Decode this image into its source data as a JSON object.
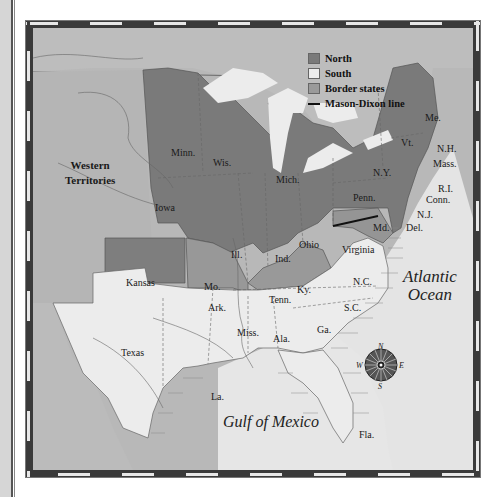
{
  "legend": {
    "items": [
      {
        "label": "North",
        "color": "#7a7a7a"
      },
      {
        "label": "South",
        "color": "#ececec"
      },
      {
        "label": "Border states",
        "color": "#9a9a9a"
      },
      {
        "label": "Mason-Dixon line",
        "color": "#111111"
      }
    ]
  },
  "regions": {
    "western_territories": [
      "Western",
      "Territories"
    ],
    "north": [
      "Minn.",
      "Wis.",
      "Mich.",
      "Iowa",
      "Ill.",
      "Ind.",
      "Ohio",
      "Kansas",
      "Penn.",
      "N.Y.",
      "Vt.",
      "Me.",
      "N.H.",
      "Mass.",
      "R.I.",
      "Conn.",
      "N.J."
    ],
    "border": [
      "Mo.",
      "Ky.",
      "Md.",
      "Del."
    ],
    "south": [
      "Virginia",
      "N.C.",
      "S.C.",
      "Ga.",
      "Fla.",
      "Ala.",
      "Miss.",
      "La.",
      "Ark.",
      "Tenn.",
      "Texas"
    ]
  },
  "labels": {
    "minn": "Minn.",
    "wis": "Wis.",
    "mich": "Mich.",
    "iowa": "Iowa",
    "ill": "Ill.",
    "ind": "Ind.",
    "ohio": "Ohio",
    "kansas": "Kansas",
    "penn": "Penn.",
    "ny": "N.Y.",
    "vt": "Vt.",
    "me": "Me.",
    "nh": "N.H.",
    "mass": "Mass.",
    "ri": "R.I.",
    "conn": "Conn.",
    "nj": "N.J.",
    "del": "Del.",
    "md": "Md.",
    "mo": "Mo.",
    "ky": "Ky.",
    "virginia": "Virginia",
    "nc": "N.C.",
    "sc": "S.C.",
    "ga": "Ga.",
    "fla": "Fla.",
    "ala": "Ala.",
    "miss": "Miss.",
    "la": "La.",
    "ark": "Ark.",
    "tenn": "Tenn.",
    "texas": "Texas",
    "western1": "Western",
    "western2": "Territories"
  },
  "water": {
    "atlantic1": "Atlantic",
    "atlantic2": "Ocean",
    "gulf": "Gulf of Mexico"
  },
  "compass": {
    "n": "N",
    "s": "S",
    "e": "E",
    "w": "W"
  },
  "colors": {
    "north": "#7a7a7a",
    "south": "#ececec",
    "border": "#9a9a9a",
    "territory": "#b8b8b8",
    "water": "#e4e4e4",
    "canada": "#bdbdbd"
  }
}
